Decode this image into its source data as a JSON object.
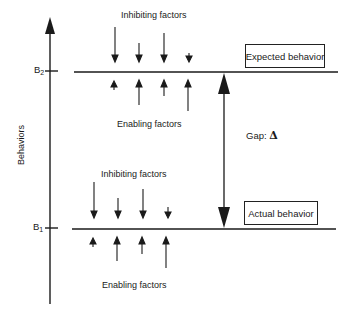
{
  "diagram": {
    "y_axis": {
      "label": "Behaviors",
      "ticks": [
        {
          "name": "B",
          "sub": "2"
        },
        {
          "name": "B",
          "sub": "1"
        }
      ]
    },
    "upper_level": {
      "box_label": "Expected behavior",
      "inhibiting_label": "Inhibiting factors",
      "enabling_label": "Enabling factors"
    },
    "lower_level": {
      "box_label": "Actual behavior",
      "inhibiting_label": "Inhibiting factors",
      "enabling_label": "Enabling factors"
    },
    "gap": {
      "label": "Gap:",
      "symbol": "Δ"
    },
    "colors": {
      "line": "#1a1a1a",
      "background": "#ffffff"
    }
  }
}
